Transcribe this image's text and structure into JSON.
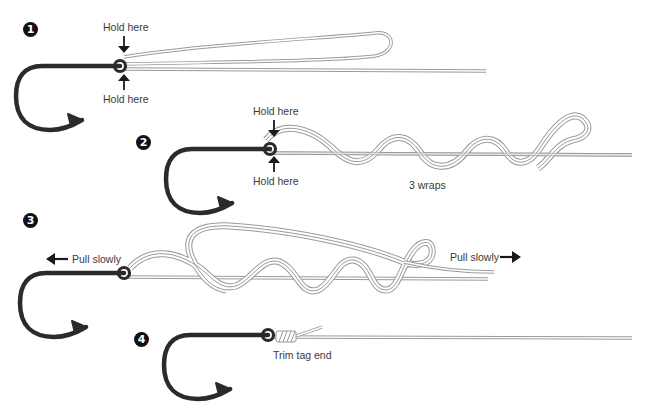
{
  "diagram": {
    "colors": {
      "hook": "#2b2b2b",
      "line_outline": "#9a9a9a",
      "line_fill": "#ffffff",
      "arrow": "#1a1a1a",
      "text": "#3a3a3a",
      "badge_bg": "#111111",
      "badge_text": "#ffffff"
    },
    "steps": [
      {
        "number": "1",
        "labels": {
          "hold_top": "Hold here",
          "hold_bottom": "Hold here"
        },
        "icons": [
          "hook-icon",
          "arrow-down-icon",
          "arrow-up-icon"
        ]
      },
      {
        "number": "2",
        "labels": {
          "hold_top": "Hold here",
          "hold_bottom": "Hold here",
          "wraps": "3 wraps"
        },
        "icons": [
          "hook-icon",
          "arrow-down-icon",
          "arrow-up-icon"
        ]
      },
      {
        "number": "3",
        "labels": {
          "pull_left": "Pull slowly",
          "pull_right": "Pull slowly"
        },
        "icons": [
          "hook-icon",
          "arrow-left-icon",
          "arrow-right-icon"
        ]
      },
      {
        "number": "4",
        "labels": {
          "trim": "Trim tag end"
        },
        "icons": [
          "hook-icon"
        ]
      }
    ]
  }
}
